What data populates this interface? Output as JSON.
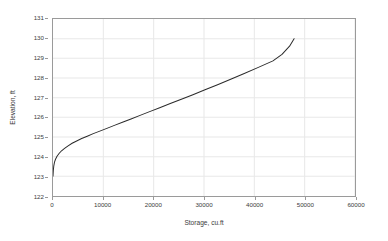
{
  "chart_data": {
    "type": "line",
    "title": "",
    "xlabel": "Storage, cu.ft",
    "ylabel": "Elevation, ft",
    "xlim": [
      0,
      60000
    ],
    "ylim": [
      122,
      131
    ],
    "xticks": [
      0,
      10000,
      20000,
      30000,
      40000,
      50000,
      60000
    ],
    "xtick_labels": [
      "0",
      "10000",
      "20000",
      "30000",
      "40000",
      "50000",
      "60000"
    ],
    "yticks": [
      122,
      123,
      124,
      125,
      126,
      127,
      128,
      129,
      130,
      131
    ],
    "ytick_labels": [
      "122",
      "123",
      "124",
      "125",
      "126",
      "127",
      "128",
      "129",
      "130",
      "131"
    ],
    "grid": true,
    "grid_color": "#e8e8e8",
    "legend": false,
    "legend_position": "none",
    "line_color": "#2b2b2b",
    "line_width": 1.0,
    "series": [
      {
        "name": "Storage-Elevation curve",
        "x": [
          0,
          60,
          150,
          300,
          500,
          800,
          1200,
          1700,
          2300,
          3000,
          3800,
          4700,
          5700,
          6800,
          8000,
          9300,
          10700,
          12200,
          13800,
          15500,
          17300,
          19200,
          21200,
          23300,
          25500,
          27800,
          30200,
          32700,
          35300,
          38000,
          40800,
          43700,
          45500,
          47000,
          47900
        ],
        "y": [
          123.0,
          123.28,
          123.52,
          123.72,
          123.87,
          124.02,
          124.16,
          124.3,
          124.42,
          124.55,
          124.68,
          124.8,
          124.92,
          125.04,
          125.17,
          125.3,
          125.44,
          125.59,
          125.75,
          125.92,
          126.1,
          126.29,
          126.49,
          126.7,
          126.92,
          127.15,
          127.4,
          127.66,
          127.94,
          128.23,
          128.54,
          128.87,
          129.2,
          129.62,
          130.0
        ]
      }
    ]
  },
  "axes": {
    "x_axis_name": "storage-axis",
    "y_axis_name": "elevation-axis"
  }
}
